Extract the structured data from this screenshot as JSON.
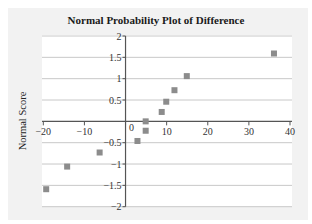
{
  "chart_data": {
    "type": "scatter",
    "title": "Normal Probability Plot of Difference",
    "xlabel": "",
    "ylabel": "Normal Score",
    "xlim": [
      -20,
      40
    ],
    "ylim": [
      -2,
      2
    ],
    "xticks": [
      -20,
      -10,
      0,
      10,
      20,
      30,
      40
    ],
    "xtick_labels": [
      "−20",
      "−10",
      "0",
      "10",
      "20",
      "30",
      "40"
    ],
    "yticks": [
      2,
      1.5,
      1,
      0.5,
      -0.5,
      -1,
      -1.5,
      -2
    ],
    "ytick_labels": [
      "2",
      "1.5",
      "1",
      "0.5",
      "−0.5",
      "−1",
      "−1.5",
      "−2"
    ],
    "grid": {
      "horizontal": true,
      "vertical": false
    },
    "legend": null,
    "marker": {
      "shape": "square",
      "color": "#8c8c8c"
    },
    "series": [
      {
        "name": "Difference",
        "points": [
          {
            "x": -19.3,
            "y": -1.59
          },
          {
            "x": -14.2,
            "y": -1.06
          },
          {
            "x": -6.3,
            "y": -0.73
          },
          {
            "x": 2.9,
            "y": -0.46
          },
          {
            "x": 4.9,
            "y": -0.22
          },
          {
            "x": 4.9,
            "y": 0.0
          },
          {
            "x": 8.8,
            "y": 0.22
          },
          {
            "x": 9.9,
            "y": 0.46
          },
          {
            "x": 11.9,
            "y": 0.73
          },
          {
            "x": 14.9,
            "y": 1.06
          },
          {
            "x": 36.1,
            "y": 1.59
          }
        ]
      }
    ]
  },
  "colors": {
    "frame_bg": "#f2f2f2",
    "plot_bg": "#ffffff",
    "gridline": "#c8c8c8",
    "axis": "#555555",
    "marker": "#8c8c8c"
  }
}
